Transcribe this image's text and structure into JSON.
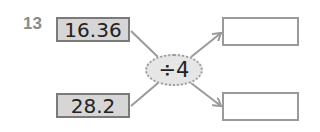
{
  "problem": {
    "number": "13",
    "inputs": [
      {
        "value": "16.36"
      },
      {
        "value": "28.2"
      }
    ],
    "operation": "÷4",
    "outputs": [
      {
        "value": ""
      },
      {
        "value": ""
      }
    ],
    "colors": {
      "input_fill": "#d6d6d6",
      "border": "#7a7a7a",
      "line": "#9a9a9a",
      "operator_fill": "#e6e6e6",
      "number_label": "#8a8a8a"
    }
  }
}
